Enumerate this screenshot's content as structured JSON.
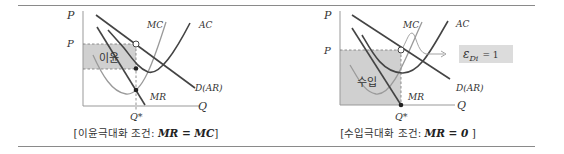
{
  "colors": {
    "rule": "#8a8a8a",
    "axis": "#999999",
    "demand": "#444444",
    "ac": "#444444",
    "mr": "#444444",
    "mc": "#9a9a9a",
    "shade": "#d0d0d0",
    "elasticity_box": "#dcdcdc"
  },
  "left_panel": {
    "y_axis_label": "P",
    "price_label": "P",
    "x_axis_label": "Q",
    "quantity_label": "Q*",
    "curves": {
      "mc": "MC",
      "ac": "AC",
      "demand": "D(AR)",
      "mr": "MR"
    },
    "area_label": "이윤",
    "caption_prefix": "[이윤극대화 조건: ",
    "caption_formula": "MR = MC",
    "caption_suffix": "]"
  },
  "right_panel": {
    "y_axis_label": "P",
    "price_label": "P",
    "x_axis_label": "Q",
    "quantity_label": "Q*",
    "curves": {
      "mc": "MC",
      "ac": "AC",
      "demand": "D(AR)",
      "mr": "MR"
    },
    "area_label": "수입",
    "elasticity_label": "ε",
    "elasticity_sub": "Di",
    "elasticity_value": "= 1",
    "caption_prefix": "[수입극대화 조건: ",
    "caption_formula": "MR = 0",
    "caption_suffix": " ]"
  }
}
